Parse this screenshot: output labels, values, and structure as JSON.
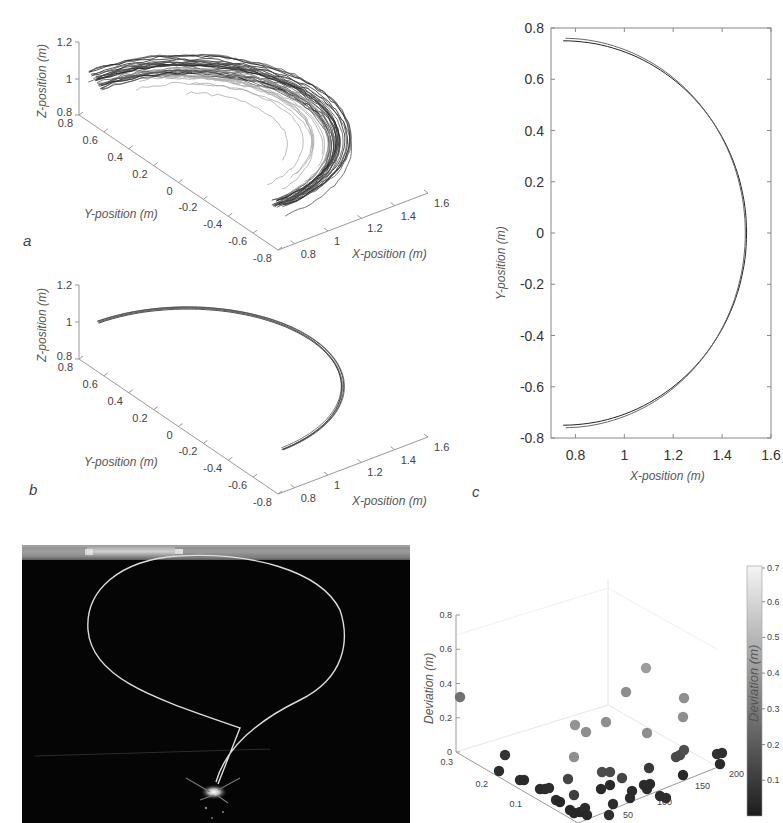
{
  "panels": {
    "a": {
      "label": "a",
      "zlabel": "Z-position (m)",
      "ylabel": "Y-position (m)",
      "xlabel": "X-position (m)",
      "zticks": [
        "1.2",
        "1",
        "0.8"
      ],
      "yticks": [
        "0.8",
        "0.6",
        "0.4",
        "0.2",
        "0",
        "-0.2",
        "-0.4",
        "-0.6",
        "-0.8"
      ],
      "xticks": [
        "0.8",
        "1",
        "1.2",
        "1.4",
        "1.6"
      ]
    },
    "b": {
      "label": "b",
      "zlabel": "Z-position (m)",
      "ylabel": "Y-position (m)",
      "xlabel": "X-position (m)",
      "zticks": [
        "1.2",
        "1",
        "0.8"
      ],
      "yticks": [
        "0.8",
        "0.6",
        "0.4",
        "0.2",
        "0",
        "-0.2",
        "-0.4",
        "-0.6",
        "-0.8"
      ],
      "xticks": [
        "0.8",
        "1",
        "1.2",
        "1.4",
        "1.6"
      ]
    },
    "c": {
      "label": "c",
      "ylabel": "Y-position (m)",
      "xlabel": "X-position (m)",
      "yticks": [
        "0.8",
        "0.6",
        "0.4",
        "0.2",
        "0",
        "-0.2",
        "-0.4",
        "-0.6",
        "-0.8"
      ],
      "xticks": [
        "0.8",
        "1",
        "1.2",
        "1.4",
        "1.6"
      ]
    },
    "scatter": {
      "zlabel": "Deviation (m)",
      "zticks": [
        "0.8",
        "0.6",
        "0.4",
        "0.2",
        "0"
      ],
      "yticks": [
        "0.3",
        "0.2",
        "0.1"
      ],
      "xticks": [
        "50",
        "100",
        "150",
        "200"
      ],
      "colorbar_label": "Deviation (m)",
      "colorbar_ticks": [
        "0.7",
        "0.6",
        "0.5",
        "0.4",
        "0.3",
        "0.2",
        "0.1"
      ]
    }
  },
  "chart_data": [
    {
      "type": "line",
      "title": "",
      "panel": "a",
      "projection": "3d",
      "xlabel": "X-position (m)",
      "ylabel": "Y-position (m)",
      "zlabel": "Z-position (m)",
      "xlim": [
        0.7,
        1.6
      ],
      "ylim": [
        -0.8,
        0.8
      ],
      "zlim": [
        0.8,
        1.2
      ],
      "description": "Many (~40) measured semicircular trajectories around center, radius ~0.75 m, height ~1.0 m, with several shorter/inner arcs",
      "series": [
        {
          "name": "trajectories",
          "shape": "semicircle",
          "center_x": 0.75,
          "radius": 0.75,
          "z": 1.0,
          "count": 40
        }
      ]
    },
    {
      "type": "line",
      "panel": "b",
      "projection": "3d",
      "xlabel": "X-position (m)",
      "ylabel": "Y-position (m)",
      "zlabel": "Z-position (m)",
      "xlim": [
        0.7,
        1.6
      ],
      "ylim": [
        -0.8,
        0.8
      ],
      "zlim": [
        0.8,
        1.2
      ],
      "description": "Few (~5) closely overlapping semicircular trajectories, radius ~0.75 m, height ~1.0 m",
      "series": [
        {
          "name": "trajectories",
          "shape": "semicircle",
          "center_x": 0.75,
          "radius": 0.75,
          "z": 1.0,
          "count": 5
        }
      ]
    },
    {
      "type": "line",
      "panel": "c",
      "xlabel": "X-position (m)",
      "ylabel": "Y-position (m)",
      "xlim": [
        0.7,
        1.6
      ],
      "ylim": [
        -0.8,
        0.8
      ],
      "xticks": [
        0.8,
        1.0,
        1.2,
        1.4,
        1.6
      ],
      "yticks": [
        -0.8,
        -0.6,
        -0.4,
        -0.2,
        0,
        0.2,
        0.4,
        0.6,
        0.8
      ],
      "series": [
        {
          "name": "path 1",
          "x": [
            0.7,
            0.8,
            1.0,
            1.2,
            1.35,
            1.45,
            1.49,
            1.5,
            1.49,
            1.45,
            1.35,
            1.2,
            1.0,
            0.8,
            0.7
          ],
          "y": [
            0.75,
            0.748,
            0.71,
            0.59,
            0.43,
            0.24,
            0.1,
            0.0,
            -0.1,
            -0.24,
            -0.43,
            -0.59,
            -0.71,
            -0.748,
            -0.75
          ]
        },
        {
          "name": "path 2",
          "x": [
            0.76,
            0.8,
            1.0,
            1.2,
            1.35,
            1.45,
            1.49,
            1.495,
            1.49,
            1.45,
            1.35,
            1.2,
            1.0,
            0.8,
            0.76
          ],
          "y": [
            0.76,
            0.755,
            0.7,
            0.58,
            0.42,
            0.23,
            0.1,
            0.0,
            -0.1,
            -0.24,
            -0.44,
            -0.6,
            -0.725,
            -0.76,
            -0.762
          ]
        }
      ]
    },
    {
      "type": "scatter",
      "panel": "scatter",
      "projection": "3d",
      "zlabel": "Deviation (m)",
      "xlim": [
        0,
        200
      ],
      "ylim": [
        0,
        0.3
      ],
      "zlim": [
        0,
        0.8
      ],
      "colorbar": {
        "label": "Deviation (m)",
        "range": [
          0,
          0.7
        ],
        "colormap": "gray"
      },
      "points_screen": [
        [
          460,
          697,
          0.3
        ],
        [
          505,
          755,
          0.08
        ],
        [
          499,
          771,
          0.06
        ],
        [
          520,
          780,
          0.06
        ],
        [
          524,
          780,
          0.05
        ],
        [
          540,
          789,
          0.05
        ],
        [
          545,
          789,
          0.05
        ],
        [
          549,
          788,
          0.06
        ],
        [
          556,
          800,
          0.05
        ],
        [
          560,
          802,
          0.04
        ],
        [
          570,
          810,
          0.04
        ],
        [
          574,
          813,
          0.04
        ],
        [
          580,
          812,
          0.04
        ],
        [
          585,
          808,
          0.05
        ],
        [
          587,
          815,
          0.04
        ],
        [
          568,
          779,
          0.14
        ],
        [
          574,
          795,
          0.12
        ],
        [
          575,
          725,
          0.42
        ],
        [
          586,
          732,
          0.4
        ],
        [
          574,
          757,
          0.4
        ],
        [
          606,
          722,
          0.4
        ],
        [
          601,
          789,
          0.05
        ],
        [
          613,
          804,
          0.06
        ],
        [
          609,
          815,
          0.06
        ],
        [
          602,
          772,
          0.16
        ],
        [
          610,
          772,
          0.16
        ],
        [
          610,
          785,
          0.05
        ],
        [
          622,
          778,
          0.14
        ],
        [
          626,
          692,
          0.4
        ],
        [
          646,
          668,
          0.45
        ],
        [
          632,
          791,
          0.05
        ],
        [
          630,
          798,
          0.05
        ],
        [
          647,
          789,
          0.06
        ],
        [
          650,
          784,
          0.05
        ],
        [
          660,
          796,
          0.06
        ],
        [
          666,
          798,
          0.06
        ],
        [
          647,
          733,
          0.4
        ],
        [
          644,
          785,
          0.05
        ],
        [
          649,
          768,
          0.1
        ],
        [
          684,
          698,
          0.4
        ],
        [
          683,
          717,
          0.4
        ],
        [
          676,
          757,
          0.16
        ],
        [
          680,
          755,
          0.16
        ],
        [
          684,
          750,
          0.18
        ],
        [
          683,
          775,
          0.04
        ],
        [
          717,
          754,
          0.08
        ],
        [
          722,
          753,
          0.07
        ],
        [
          720,
          764,
          0.05
        ]
      ]
    }
  ]
}
